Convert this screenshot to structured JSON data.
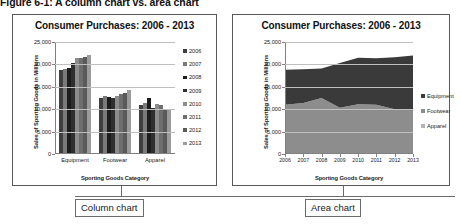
{
  "figure": {
    "caption": "Figure 6-1: A column chart vs. area chart"
  },
  "callouts": {
    "left": "Column chart",
    "right": "Area chart"
  },
  "left_panel": {
    "title": "Consumer Purchases: 2006 - 2013",
    "xlabel": "Sporting Goods Category",
    "ylabel": "Sales of Sporting Goods  in Millions"
  },
  "right_panel": {
    "title": "Consumer Purchases: 2006 - 2013",
    "xlabel": "Sporting Goods Category",
    "ylabel": "Sales of Sporting Goods  in Millions"
  },
  "chart_data": [
    {
      "type": "bar",
      "title": "Consumer Purchases: 2006 - 2013",
      "xlabel": "Sporting Goods Category",
      "ylabel": "Sales of Sporting Goods  in Millions",
      "categories": [
        "Equipment",
        "Footwear",
        "Apparel"
      ],
      "ytick_labels": [
        "0",
        "5,000",
        "10,000",
        "15,000",
        "20,000",
        "25,000"
      ],
      "ytick_values": [
        0,
        5000,
        10000,
        15000,
        20000,
        25000
      ],
      "ylim": [
        0,
        25000
      ],
      "grid": true,
      "legend_position": "right",
      "series": [
        {
          "name": "2006",
          "color": "#3f3f3f",
          "values": [
            18800,
            12600,
            11000
          ]
        },
        {
          "name": "2007",
          "color": "#7a7a7a",
          "values": [
            18900,
            12900,
            11400
          ]
        },
        {
          "name": "2008",
          "color": "#1c1c1c",
          "values": [
            19100,
            12800,
            12500
          ]
        },
        {
          "name": "2009",
          "color": "#2e2e2e",
          "values": [
            20300,
            12500,
            10300
          ]
        },
        {
          "name": "2010",
          "color": "#8c8c8c",
          "values": [
            21500,
            12900,
            11100
          ]
        },
        {
          "name": "2011",
          "color": "#6e6e6e",
          "values": [
            21400,
            13300,
            11000
          ]
        },
        {
          "name": "2012",
          "color": "#5a5a5a",
          "values": [
            21600,
            13700,
            10000
          ]
        },
        {
          "name": "2013",
          "color": "#9b9b9b",
          "values": [
            22000,
            14300,
            9800
          ]
        }
      ]
    },
    {
      "type": "area",
      "title": "Consumer Purchases: 2006 - 2013",
      "xlabel": "Sporting Goods Category",
      "ylabel": "Sales of Sporting Goods  in Millions",
      "x": [
        "2006",
        "2007",
        "2008",
        "2009",
        "2010",
        "2011",
        "2012",
        "2013"
      ],
      "ytick_labels": [
        "0",
        "5,000",
        "10,000",
        "15,000",
        "20,000",
        "25,000"
      ],
      "ytick_values": [
        0,
        5000,
        10000,
        15000,
        20000,
        25000
      ],
      "ylim": [
        0,
        25000
      ],
      "grid": true,
      "legend_position": "right",
      "series": [
        {
          "name": "Equipment",
          "color": "#3a3a3a",
          "values": [
            18800,
            18900,
            19100,
            20300,
            21500,
            21400,
            21600,
            22000
          ]
        },
        {
          "name": "Footwear",
          "color": "#8d8d8d",
          "values": [
            11000,
            11400,
            12500,
            10300,
            11100,
            11000,
            10000,
            9800
          ]
        },
        {
          "name": "Apparel",
          "color": "#b5b5b5",
          "values": [
            11000,
            11400,
            12500,
            10300,
            11100,
            11000,
            10000,
            9800
          ]
        }
      ]
    }
  ]
}
